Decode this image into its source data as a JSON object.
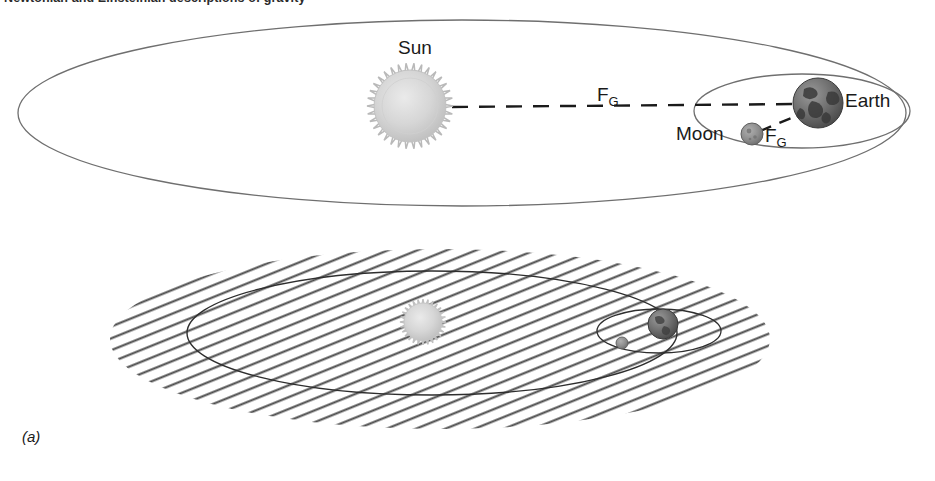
{
  "figure": {
    "caption_letter": "(a)",
    "clipped_heading": "Newtonian and Einsteinian descriptions of gravity",
    "top_panel": {
      "name": "newtonian-gravity-diagram",
      "labels": {
        "sun": "Sun",
        "earth": "Earth",
        "moon": "Moon",
        "force_sun_earth": "F",
        "force_sun_earth_sub": "G",
        "force_moon_earth": "F",
        "force_moon_earth_sub": "G"
      }
    },
    "bottom_panel": {
      "name": "spacetime-curvature-diagram"
    }
  },
  "colors": {
    "orbit_line": "#6f6f6f",
    "dashed_force_line": "#1a1a1a",
    "sun_body": "#d4d4d4",
    "sun_corona": "#b9b9b9",
    "earth_body": "#6e6e6e",
    "earth_continents": "#3c3c3c",
    "moon_body": "#8d8d8d",
    "hatch_line": "#4a4a4a",
    "text": "#1a1a1a"
  },
  "chart_data": {
    "type": "diagram",
    "bodies": [
      {
        "name": "Sun",
        "panel": "top",
        "cx": 410,
        "cy": 106,
        "r": 38,
        "shade": "#d4d4d4"
      },
      {
        "name": "Earth",
        "panel": "top",
        "cx": 818,
        "cy": 103,
        "r": 25,
        "shade": "#6e6e6e"
      },
      {
        "name": "Moon",
        "panel": "top",
        "cx": 752,
        "cy": 134,
        "r": 11,
        "shade": "#8d8d8d"
      },
      {
        "name": "Sun",
        "panel": "bottom",
        "cx": 423,
        "cy": 322,
        "r": 20,
        "shade": "#d4d4d4"
      },
      {
        "name": "Earth",
        "panel": "bottom",
        "cx": 663,
        "cy": 324,
        "r": 15,
        "shade": "#6e6e6e"
      },
      {
        "name": "Moon",
        "panel": "bottom",
        "cx": 622,
        "cy": 343,
        "r": 6,
        "shade": "#8d8d8d"
      }
    ],
    "orbits": [
      {
        "name": "earth-orbit-around-sun-top",
        "panel": "top",
        "cx": 462,
        "cy": 113,
        "rx": 444,
        "ry": 93
      },
      {
        "name": "moon-orbit-around-earth-top",
        "panel": "top",
        "cx": 802,
        "cy": 111,
        "rx": 108,
        "ry": 37
      },
      {
        "name": "earth-orbit-around-sun-bottom",
        "panel": "bottom",
        "cx": 432,
        "cy": 333,
        "rx": 245,
        "ry": 62
      },
      {
        "name": "moon-orbit-around-earth-bottom",
        "panel": "bottom",
        "cx": 659,
        "cy": 331,
        "rx": 62,
        "ry": 22
      }
    ],
    "force_vectors": [
      {
        "label": "F_G",
        "from": "Sun",
        "to": "Earth",
        "style": "dashed"
      },
      {
        "label": "F_G",
        "from": "Moon",
        "to": "Earth",
        "style": "dashed"
      }
    ],
    "spacetime_sheet": {
      "cx": 440,
      "cy": 339,
      "rx": 330,
      "ry": 90,
      "pattern": "diagonal-hatch",
      "angle_deg": -22
    }
  }
}
